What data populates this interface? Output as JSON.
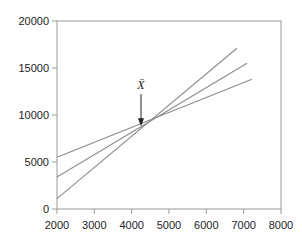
{
  "chart_data": {
    "type": "line",
    "title": "",
    "xlabel": "",
    "ylabel": "",
    "xlim": [
      2000,
      8000
    ],
    "ylim": [
      0,
      20000
    ],
    "x_ticks": [
      "2000",
      "3000",
      "4000",
      "5000",
      "6000",
      "7000",
      "8000"
    ],
    "y_ticks": [
      "0",
      "5000",
      "10000",
      "15000",
      "20000"
    ],
    "grid": false,
    "legend": null,
    "series": [
      {
        "name": "steep line",
        "x": [
          2000,
          6820
        ],
        "y": [
          1100,
          17100
        ]
      },
      {
        "name": "middle line",
        "x": [
          2000,
          7090
        ],
        "y": [
          3400,
          15500
        ]
      },
      {
        "name": "shallow line",
        "x": [
          2000,
          7220
        ],
        "y": [
          5500,
          13800
        ]
      }
    ],
    "annotations": [
      {
        "text": "X̄",
        "x": 4250,
        "y": 8700,
        "arrow": true
      }
    ]
  },
  "colors": {
    "axis": "#999999",
    "line": "#8c8c8c",
    "text": "#222222"
  }
}
